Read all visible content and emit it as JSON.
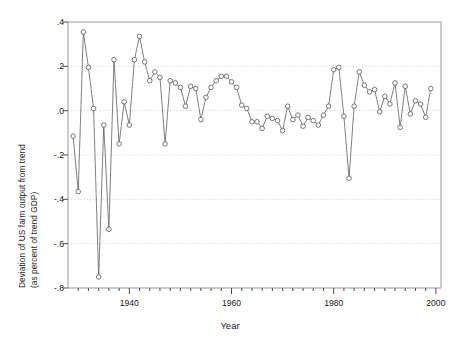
{
  "chart_data": {
    "type": "line",
    "title": "",
    "xlabel": "Year",
    "ylabel": "Deviation of US farm output from trend (as percent of trend GDP)",
    "ylabel_line1": "Deviation of US farm output from trend",
    "ylabel_line2": "(as percent of trend GDP)",
    "xlim": [
      1928,
      2001
    ],
    "ylim": [
      -0.8,
      0.4
    ],
    "grid": true,
    "gridlines_y": [
      0.2,
      0.0,
      -0.2,
      -0.4,
      -0.6
    ],
    "legend": null,
    "marker": "open-circle",
    "yticks": [
      0.4,
      0.2,
      0.0,
      -0.2,
      -0.4,
      -0.6,
      -0.8
    ],
    "ytick_labels": [
      ".4",
      ".2",
      ".0",
      "-.2",
      "-.4",
      "-.6",
      "-.8"
    ],
    "xticks_major": [
      1940,
      1960,
      1980,
      2000
    ],
    "xtick_labels": [
      "1940",
      "1960",
      "1980",
      "2000"
    ],
    "xtick_minor_step": 2,
    "xtick_minor_start": 1930,
    "xtick_minor_end": 2000,
    "series": [
      {
        "name": "Deviation of US farm output from trend",
        "color": "#555555",
        "x": [
          1929,
          1930,
          1931,
          1932,
          1933,
          1934,
          1935,
          1936,
          1937,
          1938,
          1939,
          1940,
          1941,
          1942,
          1943,
          1944,
          1945,
          1946,
          1947,
          1948,
          1949,
          1950,
          1951,
          1952,
          1953,
          1954,
          1955,
          1956,
          1957,
          1958,
          1959,
          1960,
          1961,
          1962,
          1963,
          1964,
          1965,
          1966,
          1967,
          1968,
          1969,
          1970,
          1971,
          1972,
          1973,
          1974,
          1975,
          1976,
          1977,
          1978,
          1979,
          1980,
          1981,
          1982,
          1983,
          1984,
          1985,
          1986,
          1987,
          1988,
          1989,
          1990,
          1991,
          1992,
          1993,
          1994,
          1995,
          1996,
          1997,
          1998,
          1999
        ],
        "y": [
          -0.115,
          -0.365,
          0.355,
          0.195,
          0.01,
          -0.75,
          -0.065,
          -0.535,
          0.23,
          -0.15,
          0.04,
          -0.065,
          0.23,
          0.335,
          0.22,
          0.135,
          0.175,
          0.15,
          -0.15,
          0.135,
          0.125,
          0.105,
          0.02,
          0.11,
          0.1,
          -0.04,
          0.06,
          0.105,
          0.135,
          0.155,
          0.155,
          0.13,
          0.105,
          0.025,
          0.01,
          -0.05,
          -0.05,
          -0.08,
          -0.025,
          -0.035,
          -0.045,
          -0.09,
          0.02,
          -0.04,
          -0.02,
          -0.07,
          -0.03,
          -0.045,
          -0.065,
          -0.02,
          0.02,
          0.185,
          0.195,
          -0.025,
          -0.305,
          0.02,
          0.175,
          0.115,
          0.085,
          0.095,
          -0.005,
          0.065,
          0.03,
          0.125,
          -0.075,
          0.11,
          -0.015,
          0.045,
          0.03,
          -0.03,
          0.1
        ]
      }
    ]
  },
  "axes": {
    "plot_left_px": 68,
    "plot_right_px": 441,
    "plot_top_px": 22,
    "plot_bottom_px": 288
  }
}
